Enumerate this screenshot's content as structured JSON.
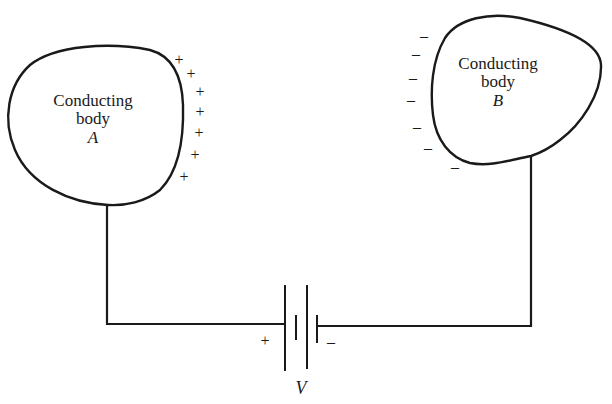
{
  "figure": {
    "type": "circuit-diagram",
    "stroke_color": "#1a1a1a",
    "background": "#ffffff"
  },
  "body_a": {
    "line1": "Conducting",
    "line2": "body",
    "name": "A",
    "charge_sign": "+",
    "charge_count": 7
  },
  "body_b": {
    "line1": "Conducting",
    "line2": "body",
    "name": "B",
    "charge_sign": "–",
    "charge_count": 7
  },
  "battery": {
    "label": "V",
    "positive_terminal": "+",
    "negative_terminal": "–"
  },
  "charges": {
    "plus": [
      "+",
      "+",
      "+",
      "+",
      "+",
      "+",
      "+"
    ],
    "minus": [
      "–",
      "–",
      "–",
      "–",
      "–",
      "–",
      "–"
    ]
  }
}
